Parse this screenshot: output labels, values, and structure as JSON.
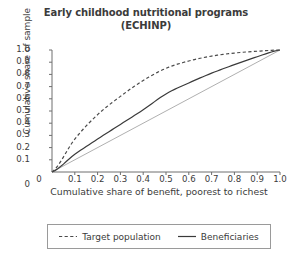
{
  "title": {
    "line1": "Early childhood nutritional programs",
    "line2": "(ECHINP)"
  },
  "axes": {
    "xlabel": "Cumulative share of benefit, poorest to richest",
    "ylabel": "Cumulative share of sample",
    "x_origin_label": "0",
    "y_origin_label": "0",
    "xticks": [
      "0.1",
      "0.2",
      "0.3",
      "0.4",
      "0.5",
      "0.6",
      "0.7",
      "0.8",
      "0.9",
      "1.0"
    ],
    "yticks": [
      "0.1",
      "0.2",
      "0.3",
      "0.4",
      "0.5",
      "0.6",
      "0.7",
      "0.8",
      "0.9",
      "1.0"
    ]
  },
  "legend": {
    "items": [
      {
        "label": "Target population",
        "style": "dashed",
        "color": "#4a4a4a"
      },
      {
        "label": "Beneficiaries",
        "style": "solid",
        "color": "#3a3a3a"
      }
    ]
  },
  "colors": {
    "background": "#ffffff",
    "axis": "#6e6e6e",
    "text": "#3b3b3b",
    "target_population": "#4a4a4a",
    "beneficiaries": "#3a3a3a",
    "equality_line": "#b0b0b0",
    "legend_border": "#9a9a9a"
  },
  "chart_data": {
    "type": "line",
    "title": "Early childhood nutritional programs (ECHINP)",
    "xlabel": "Cumulative share of benefit, poorest to richest",
    "ylabel": "Cumulative share of sample",
    "xlim": [
      0,
      1
    ],
    "ylim": [
      0,
      1
    ],
    "grid": false,
    "legend_position": "below-plot",
    "x": [
      0,
      0.1,
      0.2,
      0.3,
      0.4,
      0.5,
      0.6,
      0.7,
      0.8,
      0.9,
      1.0
    ],
    "series": [
      {
        "name": "Target population",
        "style": "dashed",
        "color": "#4a4a4a",
        "values": [
          0,
          0.27,
          0.47,
          0.62,
          0.75,
          0.85,
          0.91,
          0.95,
          0.975,
          0.99,
          1.0
        ]
      },
      {
        "name": "Beneficiaries",
        "style": "solid",
        "color": "#3a3a3a",
        "values": [
          0,
          0.145,
          0.27,
          0.39,
          0.51,
          0.64,
          0.73,
          0.81,
          0.88,
          0.945,
          1.0
        ]
      },
      {
        "name": "Line of equality",
        "style": "solid-light",
        "color": "#b0b0b0",
        "in_legend": false,
        "values": [
          0,
          0.1,
          0.2,
          0.3,
          0.4,
          0.5,
          0.6,
          0.7,
          0.8,
          0.9,
          1.0
        ]
      }
    ]
  },
  "geometry": {
    "plot_left": 52,
    "plot_right": 280,
    "plot_top": 50,
    "plot_bottom": 172
  }
}
